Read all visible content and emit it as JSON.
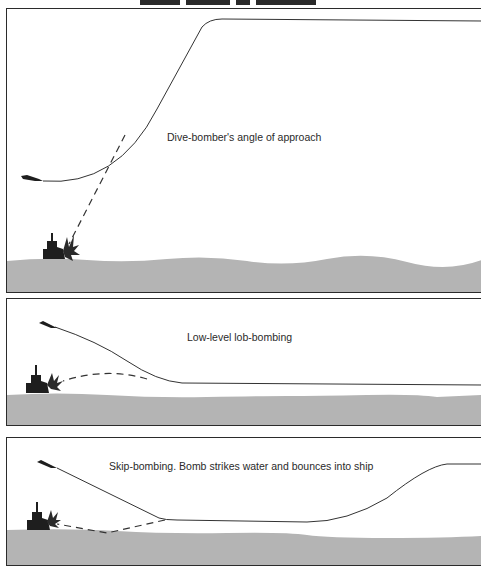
{
  "colors": {
    "sea": "#b4b4b4",
    "line": "#333333",
    "silhouette": "#1e1e1e",
    "border": "#2b2b2b",
    "background": "#ffffff"
  },
  "panels": [
    {
      "id": "dive-bombing",
      "caption": "Dive-bomber's angle of approach",
      "elements": [
        "aircraft-icon",
        "flight-path",
        "bomb-trajectory-dashed",
        "warship-icon",
        "explosion-icon",
        "sea"
      ]
    },
    {
      "id": "lob-bombing",
      "caption": "Low-level lob-bombing",
      "elements": [
        "aircraft-icon",
        "flight-path",
        "bomb-trajectory-dashed",
        "warship-icon",
        "explosion-icon",
        "sea"
      ]
    },
    {
      "id": "skip-bombing",
      "caption": "Skip-bombing. Bomb strikes water and bounces into ship",
      "elements": [
        "aircraft-icon",
        "flight-path",
        "bomb-trajectory-dashed",
        "warship-icon",
        "explosion-icon",
        "sea"
      ]
    }
  ]
}
